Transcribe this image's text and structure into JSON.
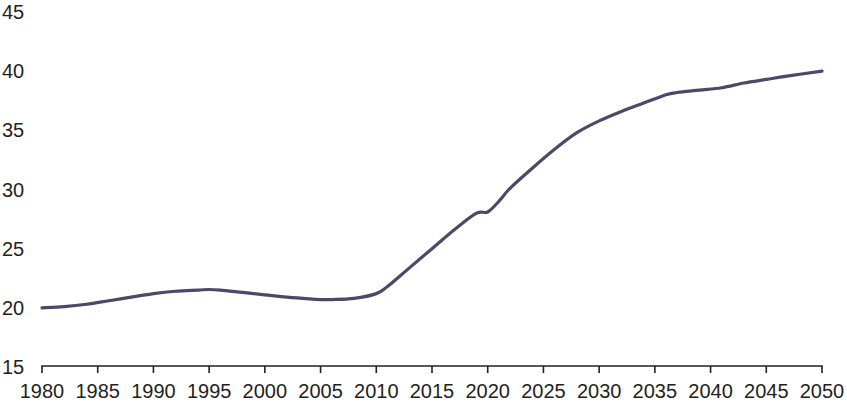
{
  "chart_data": {
    "type": "line",
    "title": "",
    "subtitle": "",
    "xlabel": "",
    "ylabel": "",
    "xlim": [
      1980,
      2050
    ],
    "ylim": [
      15,
      45
    ],
    "grid": false,
    "legend": null,
    "legend_position": "none",
    "x_tick_labels": [
      "1980",
      "1985",
      "1990",
      "1995",
      "2000",
      "2005",
      "2010",
      "2015",
      "2020",
      "2025",
      "2030",
      "2035",
      "2040",
      "2045",
      "2050"
    ],
    "x_ticks": [
      1980,
      1985,
      1990,
      1995,
      2000,
      2005,
      2010,
      2015,
      2020,
      2025,
      2030,
      2035,
      2040,
      2045,
      2050
    ],
    "y_tick_labels": [
      "15",
      "20",
      "25",
      "30",
      "35",
      "40",
      "45"
    ],
    "y_ticks": [
      15,
      20,
      25,
      30,
      35,
      40,
      45
    ],
    "series": [
      {
        "name": "series-1",
        "color": "#4a4a68",
        "line_width": 3.2,
        "x": [
          1980,
          1982,
          1984,
          1986,
          1988,
          1990,
          1992,
          1994,
          1995,
          1996,
          1998,
          2000,
          2002,
          2004,
          2005,
          2006,
          2008,
          2010,
          2011,
          2013,
          2015,
          2017,
          2019,
          2020,
          2021,
          2022,
          2024,
          2026,
          2028,
          2030,
          2032,
          2034,
          2036,
          2037,
          2039,
          2041,
          2043,
          2045,
          2047,
          2050
        ],
        "values": [
          20.0,
          20.1,
          20.3,
          20.6,
          20.9,
          21.2,
          21.4,
          21.5,
          21.55,
          21.5,
          21.3,
          21.1,
          20.9,
          20.75,
          20.7,
          20.7,
          20.8,
          21.2,
          21.8,
          23.4,
          25.0,
          26.6,
          28.0,
          28.1,
          29.0,
          30.1,
          31.8,
          33.4,
          34.8,
          35.8,
          36.6,
          37.3,
          38.0,
          38.2,
          38.4,
          38.6,
          39.0,
          39.3,
          39.6,
          40.0
        ]
      }
    ]
  },
  "axes": {
    "x_axis_name": "year-axis",
    "y_axis_name": "value-axis"
  }
}
